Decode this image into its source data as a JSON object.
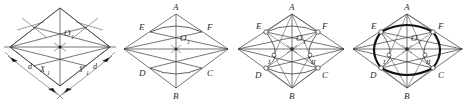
{
  "figure": {
    "kind": "geometry-construction-sequence",
    "panel_count": 4,
    "stroke_color": "#3a3a3a",
    "bold_stroke_color": "#111111",
    "background": "#ffffff"
  },
  "panels": [
    {
      "id": "panel-1",
      "caption": "",
      "labels": {
        "center": "O",
        "center_sub": "1",
        "dim_left": "d",
        "axis_x": "X",
        "axis_x_sub": "1",
        "axis_y": "Y",
        "axis_y_sub": "1",
        "dim_right": "d"
      }
    },
    {
      "id": "panel-2",
      "caption": "",
      "labels": {
        "top": "A",
        "bottom": "B",
        "upper_left": "E",
        "upper_right": "F",
        "lower_left": "D",
        "lower_right": "C",
        "center": "O",
        "center_sub": "1"
      }
    },
    {
      "id": "panel-3",
      "caption": "",
      "labels": {
        "top": "A",
        "bottom": "B",
        "upper_left": "E",
        "upper_right": "F",
        "lower_left": "D",
        "lower_right": "C",
        "center": "O",
        "center_sub": "1",
        "zone_left": "I",
        "zone_right": "II"
      }
    },
    {
      "id": "panel-4",
      "caption": "",
      "labels": {
        "top": "A",
        "bottom": "B",
        "upper_left": "E",
        "upper_right": "F",
        "lower_left": "D",
        "lower_right": "C",
        "center": "O",
        "center_sub": "1",
        "zone_left": "I",
        "zone_right": "II"
      }
    }
  ]
}
